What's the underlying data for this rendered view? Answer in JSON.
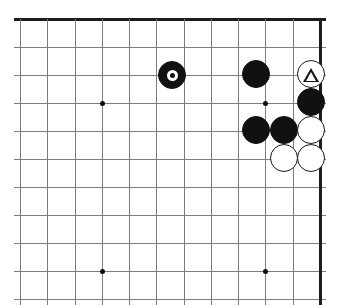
{
  "figure": {
    "kind": "go-board-diagram",
    "board_size": 19,
    "visible_columns": 12,
    "visible_rows": 11,
    "corner_shown": "top-right",
    "background_color": "#ffffff",
    "line_color": "#7d7d7d",
    "edge_color": "#1d1d1d",
    "black_color": "#111111",
    "white_color": "#ffffff"
  },
  "geometry": {
    "origin_x": 20,
    "origin_y": 19,
    "spacing": 27.2,
    "columns": 12,
    "rows": 11,
    "stone_diameter": 28,
    "top_edge_is_board_edge": true,
    "right_edge_is_board_edge": true
  },
  "grid": {
    "vertical_lines_x": [
      20,
      47,
      75,
      102,
      129,
      156,
      184,
      211,
      238,
      265,
      293,
      320
    ],
    "horizontal_lines_y": [
      19,
      47,
      75,
      103,
      131,
      159,
      187,
      215,
      243,
      271,
      299
    ],
    "edges": {
      "top_y": 19,
      "right_x": 320
    }
  },
  "star_points": [
    {
      "name": "star-point-left-upper",
      "col": 3,
      "row": 3,
      "x": 102,
      "y": 103
    },
    {
      "name": "star-point-right-upper",
      "col": 8,
      "row": 3,
      "x": 265,
      "y": 103
    },
    {
      "name": "star-point-left-lower",
      "col": 3,
      "row": 9,
      "x": 102,
      "y": 271
    },
    {
      "name": "star-point-right-lower",
      "col": 8,
      "row": 9,
      "x": 265,
      "y": 271
    }
  ],
  "stones": [
    {
      "id": "black-marked-circle",
      "color": "black",
      "mark": "circle",
      "col": 6,
      "row": 2,
      "x": 172,
      "y": 75
    },
    {
      "id": "black-upper",
      "color": "black",
      "mark": "none",
      "col": 9,
      "row": 2,
      "x": 256,
      "y": 74
    },
    {
      "id": "white-marked-triangle",
      "color": "white",
      "mark": "triangle",
      "col": 11,
      "row": 2,
      "x": 311,
      "y": 74
    },
    {
      "id": "black-right",
      "color": "black",
      "mark": "none",
      "col": 11,
      "row": 3,
      "x": 311,
      "y": 102
    },
    {
      "id": "black-lower-left",
      "color": "black",
      "mark": "none",
      "col": 9,
      "row": 4,
      "x": 256,
      "y": 130
    },
    {
      "id": "black-lower-middle",
      "color": "black",
      "mark": "none",
      "col": 10,
      "row": 4,
      "x": 284,
      "y": 130
    },
    {
      "id": "white-middle-right",
      "color": "white",
      "mark": "none",
      "col": 11,
      "row": 4,
      "x": 311,
      "y": 130
    },
    {
      "id": "white-bottom-left",
      "color": "white",
      "mark": "none",
      "col": 10,
      "row": 5,
      "x": 284,
      "y": 158
    },
    {
      "id": "white-bottom-right",
      "color": "white",
      "mark": "none",
      "col": 11,
      "row": 5,
      "x": 311,
      "y": 158
    }
  ]
}
